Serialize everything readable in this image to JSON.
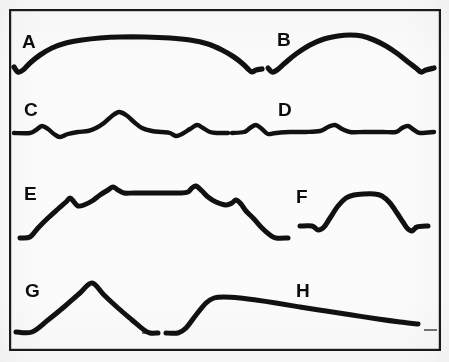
{
  "figure": {
    "title": "",
    "background_color": "#fbfbfb",
    "ink_color": "#111111",
    "frame": {
      "x": 9,
      "y": 9,
      "width": 431,
      "height": 341,
      "stroke_width": 2.2
    }
  },
  "chart_data": {
    "type": "line",
    "title": "",
    "xlabel": "",
    "ylabel": "",
    "grid": false,
    "legend": "none",
    "panels": [
      {
        "label": "A",
        "label_x": 22,
        "label_y": 48,
        "row": 1,
        "column": "left",
        "baseline_y": 70,
        "stroke_width": 5.2,
        "shape": "broad flat-topped plateau with small notch dips at both ends",
        "points": [
          [
            14,
            67
          ],
          [
            18,
            72
          ],
          [
            23,
            70
          ],
          [
            30,
            63
          ],
          [
            40,
            55
          ],
          [
            52,
            48
          ],
          [
            66,
            43
          ],
          [
            82,
            40
          ],
          [
            100,
            38
          ],
          [
            120,
            37
          ],
          [
            145,
            37
          ],
          [
            170,
            38
          ],
          [
            190,
            40
          ],
          [
            208,
            44
          ],
          [
            222,
            50
          ],
          [
            234,
            57
          ],
          [
            243,
            64
          ],
          [
            248,
            69
          ],
          [
            252,
            72
          ],
          [
            256,
            70
          ],
          [
            262,
            69
          ]
        ]
      },
      {
        "label": "B",
        "label_x": 277,
        "label_y": 46,
        "row": 1,
        "column": "right",
        "baseline_y": 70,
        "stroke_width": 5.2,
        "shape": "single rounded dome with notch dips at both ends",
        "points": [
          [
            268,
            68
          ],
          [
            272,
            72
          ],
          [
            277,
            70
          ],
          [
            285,
            63
          ],
          [
            296,
            54
          ],
          [
            310,
            45
          ],
          [
            324,
            39
          ],
          [
            338,
            36
          ],
          [
            350,
            35
          ],
          [
            362,
            36
          ],
          [
            374,
            40
          ],
          [
            386,
            46
          ],
          [
            398,
            54
          ],
          [
            408,
            62
          ],
          [
            416,
            68
          ],
          [
            421,
            72
          ],
          [
            426,
            70
          ],
          [
            434,
            68
          ]
        ]
      },
      {
        "label": "C",
        "label_x": 24,
        "label_y": 116,
        "row": 2,
        "column": "left",
        "baseline_y": 133,
        "stroke_width": 4.4,
        "shape": "low ripples with one tall central peak",
        "points": [
          [
            14,
            133
          ],
          [
            30,
            133
          ],
          [
            36,
            130
          ],
          [
            42,
            126
          ],
          [
            48,
            129
          ],
          [
            54,
            134
          ],
          [
            60,
            137
          ],
          [
            68,
            134
          ],
          [
            78,
            132
          ],
          [
            88,
            131
          ],
          [
            96,
            128
          ],
          [
            104,
            123
          ],
          [
            112,
            116
          ],
          [
            119,
            112
          ],
          [
            126,
            115
          ],
          [
            134,
            122
          ],
          [
            142,
            128
          ],
          [
            152,
            131
          ],
          [
            162,
            132
          ],
          [
            170,
            133
          ],
          [
            176,
            136
          ],
          [
            182,
            134
          ],
          [
            190,
            129
          ],
          [
            197,
            125
          ],
          [
            203,
            128
          ],
          [
            210,
            132
          ],
          [
            218,
            133
          ],
          [
            228,
            133
          ]
        ]
      },
      {
        "label": "D",
        "label_x": 278,
        "label_y": 116,
        "row": 2,
        "column": "right",
        "baseline_y": 133,
        "stroke_width": 4.4,
        "shape": "nearly flat trace with three small evenly spaced bumps",
        "points": [
          [
            232,
            133
          ],
          [
            244,
            132
          ],
          [
            250,
            128
          ],
          [
            256,
            125
          ],
          [
            262,
            129
          ],
          [
            268,
            134
          ],
          [
            276,
            133
          ],
          [
            290,
            132
          ],
          [
            306,
            132
          ],
          [
            320,
            131
          ],
          [
            328,
            127
          ],
          [
            335,
            125
          ],
          [
            342,
            129
          ],
          [
            350,
            132
          ],
          [
            364,
            132
          ],
          [
            382,
            132
          ],
          [
            396,
            132
          ],
          [
            402,
            128
          ],
          [
            408,
            126
          ],
          [
            414,
            130
          ],
          [
            420,
            133
          ],
          [
            434,
            132
          ]
        ]
      },
      {
        "label": "E",
        "label_x": 24,
        "label_y": 200,
        "row": 3,
        "column": "left",
        "baseline_y": 238,
        "stroke_width": 5.0,
        "shape": "staircase rise to long plateau, second peak, then steep fall",
        "points": [
          [
            20,
            238
          ],
          [
            30,
            237
          ],
          [
            38,
            228
          ],
          [
            48,
            218
          ],
          [
            58,
            209
          ],
          [
            66,
            202
          ],
          [
            70,
            198
          ],
          [
            74,
            202
          ],
          [
            78,
            206
          ],
          [
            84,
            205
          ],
          [
            92,
            201
          ],
          [
            100,
            195
          ],
          [
            108,
            190
          ],
          [
            113,
            187
          ],
          [
            118,
            190
          ],
          [
            124,
            193
          ],
          [
            134,
            193
          ],
          [
            150,
            193
          ],
          [
            166,
            193
          ],
          [
            180,
            193
          ],
          [
            188,
            192
          ],
          [
            192,
            188
          ],
          [
            196,
            186
          ],
          [
            202,
            191
          ],
          [
            208,
            197
          ],
          [
            216,
            202
          ],
          [
            226,
            205
          ],
          [
            232,
            203
          ],
          [
            236,
            200
          ],
          [
            241,
            204
          ],
          [
            246,
            211
          ],
          [
            254,
            219
          ],
          [
            262,
            228
          ],
          [
            270,
            235
          ],
          [
            276,
            238
          ],
          [
            288,
            238
          ]
        ]
      },
      {
        "label": "F",
        "label_x": 296,
        "label_y": 203,
        "row": 3,
        "column": "right",
        "baseline_y": 227,
        "stroke_width": 5.0,
        "shape": "flat-topped mesa with notch dips at both ends",
        "points": [
          [
            300,
            226
          ],
          [
            312,
            226
          ],
          [
            318,
            230
          ],
          [
            324,
            227
          ],
          [
            330,
            218
          ],
          [
            338,
            206
          ],
          [
            346,
            198
          ],
          [
            354,
            195
          ],
          [
            364,
            194
          ],
          [
            374,
            194
          ],
          [
            382,
            196
          ],
          [
            390,
            203
          ],
          [
            397,
            213
          ],
          [
            403,
            222
          ],
          [
            407,
            228
          ],
          [
            412,
            231
          ],
          [
            417,
            227
          ],
          [
            428,
            226
          ]
        ]
      },
      {
        "label": "G",
        "label_x": 25,
        "label_y": 297,
        "row": 4,
        "column": "left",
        "baseline_y": 332,
        "stroke_width": 5.0,
        "shape": "symmetric triangular peak",
        "points": [
          [
            16,
            332
          ],
          [
            32,
            332
          ],
          [
            48,
            320
          ],
          [
            64,
            307
          ],
          [
            80,
            293
          ],
          [
            92,
            283
          ],
          [
            104,
            295
          ],
          [
            118,
            308
          ],
          [
            132,
            320
          ],
          [
            144,
            330
          ],
          [
            150,
            333
          ],
          [
            158,
            333
          ]
        ]
      },
      {
        "label": "H",
        "label_x": 296,
        "label_y": 297,
        "row": 4,
        "column": "right",
        "baseline_y": 332,
        "stroke_width": 5.0,
        "shape": "steep rise to a shoulder then long gentle decline",
        "points": [
          [
            166,
            333
          ],
          [
            178,
            333
          ],
          [
            186,
            328
          ],
          [
            196,
            315
          ],
          [
            206,
            303
          ],
          [
            214,
            298
          ],
          [
            224,
            297
          ],
          [
            240,
            298
          ],
          [
            256,
            300
          ],
          [
            276,
            303
          ],
          [
            300,
            307
          ],
          [
            326,
            311
          ],
          [
            352,
            315
          ],
          [
            378,
            319
          ],
          [
            400,
            322
          ],
          [
            418,
            324
          ]
        ]
      }
    ],
    "baseline_segments": [
      {
        "name": "baseline-c-left",
        "x1": 12,
        "y1": 133,
        "x2": 32,
        "y2": 133
      },
      {
        "name": "baseline-c-right",
        "x1": 210,
        "y1": 133,
        "x2": 229,
        "y2": 133
      },
      {
        "name": "baseline-d-left",
        "x1": 231,
        "y1": 133,
        "x2": 246,
        "y2": 133
      },
      {
        "name": "baseline-d-right",
        "x1": 418,
        "y1": 132,
        "x2": 435,
        "y2": 132
      },
      {
        "name": "baseline-e-end",
        "x1": 274,
        "y1": 238,
        "x2": 289,
        "y2": 238
      },
      {
        "name": "baseline-f-left",
        "x1": 299,
        "y1": 226,
        "x2": 315,
        "y2": 226
      },
      {
        "name": "baseline-f-right",
        "x1": 414,
        "y1": 226,
        "x2": 430,
        "y2": 226
      },
      {
        "name": "baseline-g-left",
        "x1": 14,
        "y1": 332,
        "x2": 34,
        "y2": 332
      },
      {
        "name": "baseline-g-right",
        "x1": 142,
        "y1": 333,
        "x2": 159,
        "y2": 333
      },
      {
        "name": "baseline-h-left",
        "x1": 164,
        "y1": 333,
        "x2": 180,
        "y2": 333
      },
      {
        "name": "baseline-h-tick",
        "x1": 424,
        "y1": 330,
        "x2": 437,
        "y2": 330
      }
    ]
  }
}
